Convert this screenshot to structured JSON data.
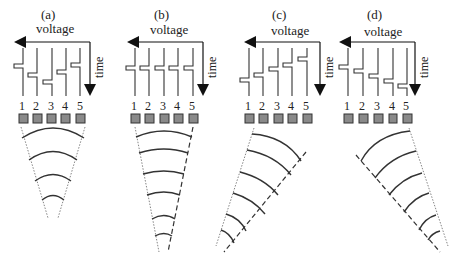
{
  "figure": {
    "panels": [
      {
        "id": "a",
        "label": "(a)",
        "axis_label_x": "voltage",
        "axis_label_y": "time",
        "element_numbers": [
          "1",
          "2",
          "3",
          "4",
          "5"
        ],
        "pulse_delay_profile": "symmetric-focus (center delayed most)",
        "beam": "focused, symmetric",
        "wavefront_count": 4
      },
      {
        "id": "b",
        "label": "(b)",
        "axis_label_x": "voltage",
        "axis_label_y": "time",
        "element_numbers": [
          "1",
          "2",
          "3",
          "4",
          "5"
        ],
        "pulse_delay_profile": "uniform (no delay)",
        "beam": "straight, plane",
        "wavefront_count": 6
      },
      {
        "id": "c",
        "label": "(c)",
        "axis_label_x": "voltage",
        "axis_label_y": "time",
        "element_numbers": [
          "1",
          "2",
          "3",
          "4",
          "5"
        ],
        "pulse_delay_profile": "linear (element 1 delayed most)",
        "beam": "steered left",
        "wavefront_count": 6
      },
      {
        "id": "d",
        "label": "(d)",
        "axis_label_x": "voltage",
        "axis_label_y": "time",
        "element_numbers": [
          "1",
          "2",
          "3",
          "4",
          "5"
        ],
        "pulse_delay_profile": "linear (element 5 delayed most)",
        "beam": "steered right",
        "wavefront_count": 6
      }
    ],
    "colors": {
      "line": "#222222",
      "element_fill": "#8a8a8a",
      "element_stroke": "#333333",
      "background": "#ffffff"
    }
  }
}
